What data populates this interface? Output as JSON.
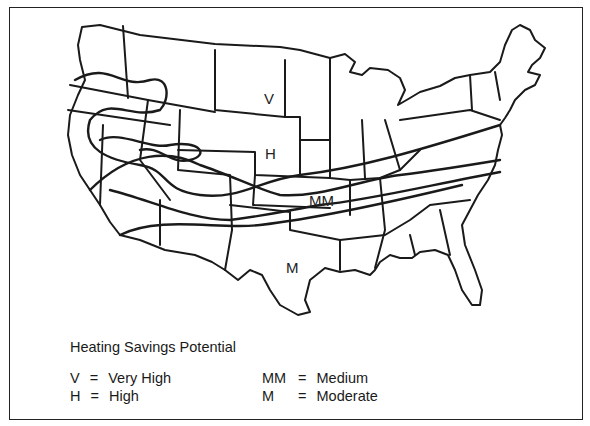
{
  "map": {
    "title": "Heating Savings Potential",
    "zone_labels": [
      {
        "code": "V",
        "x": 264,
        "y": 92
      },
      {
        "code": "H",
        "x": 265,
        "y": 146
      },
      {
        "code": "MM",
        "x": 309,
        "y": 193
      },
      {
        "code": "M",
        "x": 286,
        "y": 260
      }
    ]
  },
  "legend": {
    "title": "Heating Savings Potential",
    "items": [
      {
        "code": "V",
        "eq": "=",
        "label": "Very High"
      },
      {
        "code": "H",
        "eq": "=",
        "label": "High"
      },
      {
        "code": "MM",
        "eq": "=",
        "label": "Medium"
      },
      {
        "code": "M",
        "eq": "=",
        "label": "Moderate"
      }
    ]
  }
}
